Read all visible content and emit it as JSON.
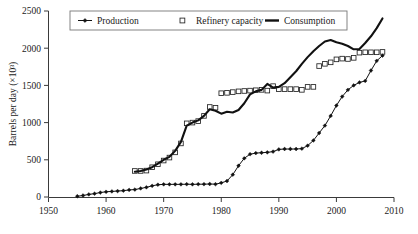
{
  "chart_data": {
    "type": "line",
    "title": "",
    "xlabel": "",
    "ylabel": "Barrels per day (×10³)",
    "xlim": [
      1950,
      2010
    ],
    "ylim": [
      0,
      2500
    ],
    "grid": false,
    "legend_position": "top-center",
    "x_ticks": [
      "1950",
      "1960",
      "1970",
      "1980",
      "1990",
      "2000",
      "2010"
    ],
    "x_tick_values": [
      1950,
      1960,
      1970,
      1980,
      1990,
      2000,
      2010
    ],
    "y_ticks": [
      "0",
      "500",
      "1000",
      "1500",
      "2000",
      "2500"
    ],
    "y_tick_values": [
      0,
      500,
      1000,
      1500,
      2000,
      2500
    ],
    "series": [
      {
        "name": "Production",
        "marker": "filled-diamond",
        "line_style": "thin-solid",
        "color": "#111111",
        "x": [
          1955,
          1956,
          1957,
          1958,
          1959,
          1960,
          1961,
          1962,
          1963,
          1964,
          1965,
          1966,
          1967,
          1968,
          1969,
          1970,
          1971,
          1972,
          1973,
          1974,
          1975,
          1976,
          1977,
          1978,
          1979,
          1980,
          1981,
          1982,
          1983,
          1984,
          1985,
          1986,
          1987,
          1988,
          1989,
          1990,
          1991,
          1992,
          1993,
          1994,
          1995,
          1996,
          1997,
          1998,
          1999,
          2000,
          2001,
          2002,
          2003,
          2004,
          2005,
          2006,
          2007,
          2008
        ],
        "values": [
          10,
          20,
          35,
          45,
          60,
          70,
          75,
          80,
          85,
          95,
          100,
          115,
          130,
          150,
          165,
          170,
          170,
          170,
          170,
          172,
          170,
          172,
          172,
          175,
          172,
          190,
          215,
          300,
          420,
          520,
          575,
          590,
          595,
          600,
          610,
          640,
          645,
          645,
          645,
          650,
          690,
          760,
          860,
          960,
          1090,
          1230,
          1350,
          1440,
          1500,
          1540,
          1560,
          1700,
          1830,
          1900
        ]
      },
      {
        "name": "Refinery capacity",
        "marker": "open-square",
        "line_style": "none",
        "color": "#222222",
        "x": [
          1965,
          1966,
          1967,
          1968,
          1969,
          1970,
          1971,
          1972,
          1973,
          1974,
          1975,
          1976,
          1977,
          1978,
          1979,
          1980,
          1981,
          1982,
          1983,
          1984,
          1985,
          1986,
          1987,
          1988,
          1989,
          1990,
          1991,
          1992,
          1993,
          1994,
          1995,
          1996,
          1997,
          1998,
          1999,
          2000,
          2001,
          2002,
          2003,
          2004,
          2005,
          2006,
          2007,
          2008
        ],
        "values": [
          350,
          350,
          355,
          400,
          440,
          490,
          530,
          600,
          720,
          990,
          1000,
          1020,
          1090,
          1210,
          1200,
          1395,
          1400,
          1410,
          1420,
          1425,
          1430,
          1435,
          1440,
          1430,
          1490,
          1450,
          1450,
          1450,
          1450,
          1440,
          1480,
          1480,
          1760,
          1790,
          1810,
          1850,
          1860,
          1855,
          1870,
          1940,
          1945,
          1945,
          1945,
          1950
        ]
      },
      {
        "name": "Consumption",
        "marker": "none",
        "line_style": "thick-solid",
        "color": "#111111",
        "x": [
          1965,
          1966,
          1967,
          1968,
          1969,
          1970,
          1971,
          1972,
          1973,
          1974,
          1975,
          1976,
          1977,
          1978,
          1979,
          1980,
          1981,
          1982,
          1983,
          1984,
          1985,
          1986,
          1987,
          1988,
          1989,
          1990,
          1991,
          1992,
          1993,
          1994,
          1995,
          1996,
          1997,
          1998,
          1999,
          2000,
          2001,
          2002,
          2003,
          2004,
          2005,
          2006,
          2007,
          2008
        ],
        "values": [
          340,
          350,
          370,
          400,
          450,
          500,
          540,
          620,
          740,
          960,
          1000,
          1030,
          1090,
          1180,
          1160,
          1120,
          1145,
          1135,
          1170,
          1260,
          1380,
          1420,
          1440,
          1520,
          1470,
          1480,
          1530,
          1610,
          1690,
          1790,
          1880,
          1960,
          2030,
          2090,
          2110,
          2080,
          2060,
          2030,
          1985,
          1990,
          2070,
          2160,
          2270,
          2400
        ]
      }
    ]
  },
  "legend": {
    "items": [
      {
        "label": "Production",
        "key": "production"
      },
      {
        "label": "Refinery capacity",
        "key": "refinery-capacity"
      },
      {
        "label": "Consumption",
        "key": "consumption"
      }
    ]
  }
}
